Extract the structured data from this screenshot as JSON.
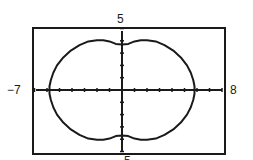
{
  "chart_data": {
    "type": "line",
    "title": "",
    "subtitle": "Polar curve (peanut-shaped limaçon) on graphing calculator window",
    "xlabel": "",
    "ylabel": "",
    "window": {
      "xmin_label": "−7",
      "xmax_label": "8",
      "ymax_label": "5",
      "ymin_label": "−5",
      "xlim": [
        -7,
        8
      ],
      "ylim": [
        -5,
        5
      ],
      "xscl": 1,
      "yscl": 1
    },
    "grid": false,
    "legend": null,
    "series": [
      {
        "name": "curve",
        "points_upper_right": [
          [
            0.0,
            3.7
          ],
          [
            0.5,
            3.75
          ],
          [
            1.0,
            3.95
          ],
          [
            1.5,
            4.05
          ],
          [
            2.0,
            4.05
          ],
          [
            2.7,
            3.95
          ],
          [
            3.4,
            3.65
          ],
          [
            4.1,
            3.2
          ],
          [
            4.7,
            2.65
          ],
          [
            5.2,
            2.0
          ],
          [
            5.5,
            1.4
          ],
          [
            5.7,
            0.8
          ],
          [
            5.8,
            0.3
          ],
          [
            5.8,
            0.0
          ]
        ],
        "symmetry": "both-axes",
        "x_intercepts": [
          -5.8,
          5.8
        ],
        "y_intercepts": [
          -3.7,
          3.7
        ]
      }
    ],
    "colors": {
      "curve": "#1a1a1a",
      "axes": "#1a1a1a",
      "frame": "#1a1a1a",
      "background": "#ffffff"
    }
  }
}
